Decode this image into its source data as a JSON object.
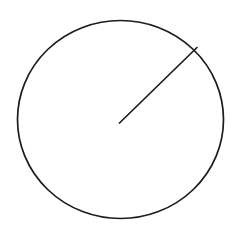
{
  "canvas": {
    "width": 238,
    "height": 225,
    "background_color": "#ffffff"
  },
  "figure": {
    "name": "circle-with-radius",
    "stroke_color": "#1c1c1c",
    "stroke_width": 1.7,
    "fill": "none"
  },
  "chart_data": {
    "type": "diagram",
    "title": "",
    "subtitle": "",
    "xlabel": "",
    "ylabel": "",
    "grid": false,
    "legend": null,
    "annotations": [],
    "shapes": [
      {
        "name": "circle",
        "kind": "ellipse",
        "cx": 120.5,
        "cy": 119.5,
        "rx": 103,
        "ry": 99,
        "stroke": "#1c1c1c",
        "stroke_width": 1.7,
        "fill": "none"
      },
      {
        "name": "radius-line",
        "kind": "line",
        "x1": 119.5,
        "y1": 123,
        "x2": 197,
        "y2": 47.5,
        "length": 108,
        "angle_degrees": 44,
        "stroke": "#1c1c1c",
        "stroke_width": 1.7
      }
    ]
  }
}
